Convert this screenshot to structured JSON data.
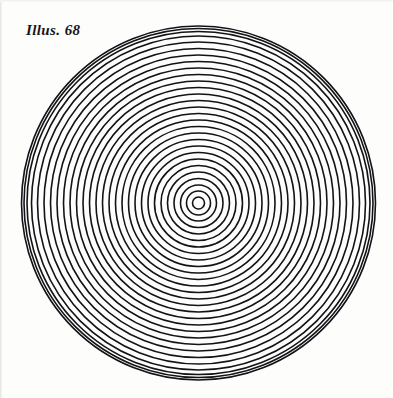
{
  "page": {
    "title": "Illus. 68",
    "background_color": "#fdfdfc",
    "width": 393,
    "height": 398
  },
  "caption": {
    "label": "Illus. 68",
    "style": "italic-serif",
    "color": "#15161a"
  },
  "figure": {
    "name": "concentric-circles-target",
    "stroke_color": "#121317",
    "fill_color": "none",
    "center_x": 198.5,
    "center_y": 203,
    "outer_radius": 177,
    "inner_radius": 6,
    "ring_count": 29,
    "stroke_width": 1.6,
    "radii": [
      6,
      12,
      18,
      24.5,
      31,
      37.5,
      44,
      50.5,
      57,
      63.5,
      70,
      76.5,
      83,
      89.5,
      96,
      102.5,
      109,
      115.5,
      122,
      128.5,
      135,
      141.5,
      148,
      154.5,
      161,
      167,
      171.5,
      174.5,
      177
    ]
  },
  "chart_data": {
    "type": "line",
    "title": "Illus. 68",
    "xlabel": "",
    "ylabel": "",
    "categories": [
      "ring-1",
      "ring-2",
      "ring-3",
      "ring-4",
      "ring-5",
      "ring-6",
      "ring-7",
      "ring-8",
      "ring-9",
      "ring-10",
      "ring-11",
      "ring-12",
      "ring-13",
      "ring-14",
      "ring-15",
      "ring-16",
      "ring-17",
      "ring-18",
      "ring-19",
      "ring-20",
      "ring-21",
      "ring-22",
      "ring-23",
      "ring-24",
      "ring-25",
      "ring-26",
      "ring-27",
      "ring-28",
      "ring-29"
    ],
    "values": [
      6,
      12,
      18,
      24.5,
      31,
      37.5,
      44,
      50.5,
      57,
      63.5,
      70,
      76.5,
      83,
      89.5,
      96,
      102.5,
      109,
      115.5,
      122,
      128.5,
      135,
      141.5,
      148,
      154.5,
      161,
      167,
      171.5,
      174.5,
      177
    ]
  }
}
